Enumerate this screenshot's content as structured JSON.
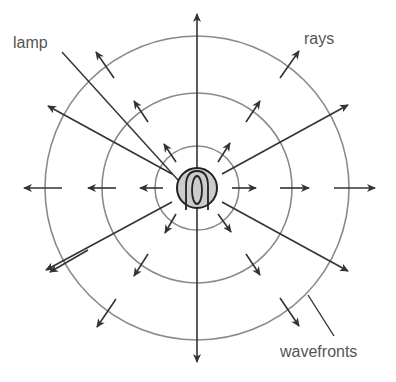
{
  "diagram": {
    "labels": {
      "lamp": "lamp",
      "rays": "rays",
      "wavefronts": "wavefronts"
    },
    "colors": {
      "wavefront": "#8a8a8a",
      "ray": "#333333",
      "lamp_fill": "#cccccc",
      "text": "#555555"
    },
    "center": [
      197,
      188
    ],
    "lamp_radius": 20,
    "wavefront_radii": [
      42,
      95,
      152
    ],
    "ray_angles_deg": [
      -90,
      90,
      -30,
      30,
      150,
      210
    ]
  }
}
